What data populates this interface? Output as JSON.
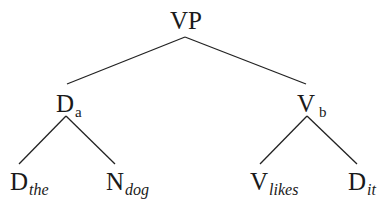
{
  "diagram": {
    "type": "syntax-tree",
    "root": {
      "label": "VP",
      "subscript": ""
    },
    "left_child": {
      "label": "D",
      "subscript": "a"
    },
    "right_child": {
      "label": "V",
      "subscript": "b"
    },
    "leaves": [
      {
        "label": "D",
        "subscript": "the",
        "parent": "Da"
      },
      {
        "label": "N",
        "subscript": "dog",
        "parent": "Da"
      },
      {
        "label": "V",
        "subscript": "likes",
        "parent": "Vb"
      },
      {
        "label": "D",
        "subscript": "it",
        "parent": "Vb"
      }
    ],
    "edges": [
      [
        "VP",
        "Da"
      ],
      [
        "VP",
        "Vb"
      ],
      [
        "Da",
        "Dthe"
      ],
      [
        "Da",
        "Ndog"
      ],
      [
        "Vb",
        "Vlikes"
      ],
      [
        "Vb",
        "Dit"
      ]
    ],
    "colors": {
      "line": "#222222",
      "text": "#1a1a1a",
      "background": "#ffffff"
    }
  }
}
